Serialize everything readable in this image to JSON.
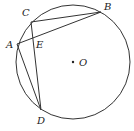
{
  "diagram": {
    "circle": {
      "cx": 73,
      "cy": 62,
      "r": 57,
      "center_label": "O"
    },
    "points": {
      "A": {
        "x": 17,
        "y": 44,
        "label": "A"
      },
      "B": {
        "x": 101,
        "y": 12,
        "label": "B"
      },
      "C": {
        "x": 31,
        "y": 22,
        "label": "C"
      },
      "D": {
        "x": 41,
        "y": 110,
        "label": "D"
      },
      "E": {
        "label": "E"
      }
    },
    "segments": [
      "CB",
      "AB",
      "CD",
      "AD"
    ],
    "stroke_color": "#333333"
  }
}
